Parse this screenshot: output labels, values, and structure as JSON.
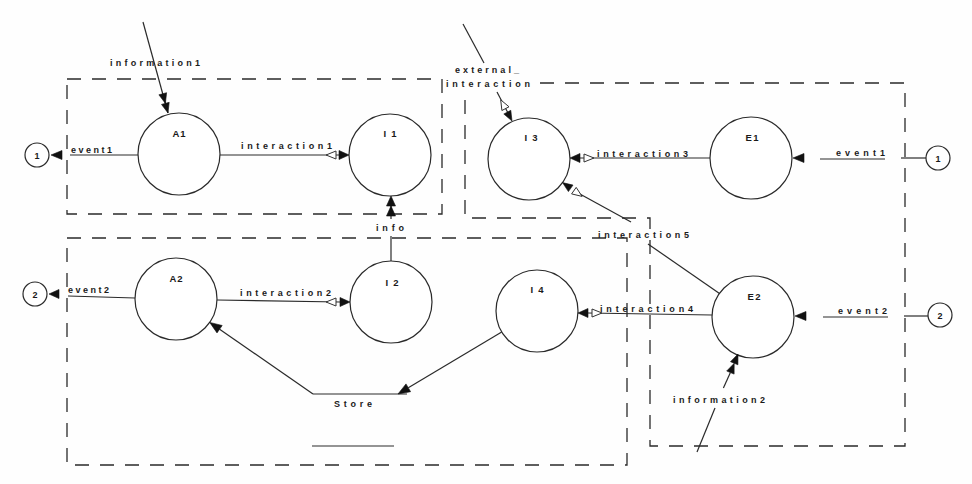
{
  "nodes": {
    "A1": {
      "label": "A1"
    },
    "I1": {
      "label": "I1"
    },
    "I3": {
      "label": "I3"
    },
    "E1": {
      "label": "E1"
    },
    "A2": {
      "label": "A2"
    },
    "I2": {
      "label": "I2"
    },
    "I4": {
      "label": "I4"
    },
    "E2": {
      "label": "E2"
    }
  },
  "connectors": {
    "left_1": "1",
    "left_2": "2",
    "right_1": "1",
    "right_2": "2"
  },
  "store": {
    "label": "Store"
  },
  "flows": {
    "information1": "information1",
    "external_interaction_line1": "external_",
    "external_interaction_line2": "interaction",
    "interaction1": "interaction1",
    "interaction2": "interaction2",
    "interaction3": "interaction3",
    "interaction4": "interaction4",
    "interaction5": "interaction5",
    "info": "info",
    "information2": "information2",
    "event1_left": "event1",
    "event2_left": "event2",
    "event1_right": "event1",
    "event2_right": "event2"
  },
  "edges": [
    {
      "label": "information1",
      "from": null,
      "to": "A1"
    },
    {
      "label": "external_interaction",
      "from": null,
      "to": "I3"
    },
    {
      "label": "interaction1",
      "from": "A1",
      "to": "I1"
    },
    {
      "label": "interaction2",
      "from": "A2",
      "to": "I2"
    },
    {
      "label": "interaction3",
      "from": "E1",
      "to": "I3"
    },
    {
      "label": "interaction4",
      "from": "E2",
      "to": "I4"
    },
    {
      "label": "interaction5",
      "from": "E2",
      "to": "I3"
    },
    {
      "label": "info",
      "from": "I2",
      "to": "I1"
    },
    {
      "label": "information2",
      "from": null,
      "to": "E2"
    },
    {
      "label": "event1",
      "from": "A1",
      "to": "1"
    },
    {
      "label": "event2",
      "from": "A2",
      "to": "2"
    },
    {
      "label": "event1",
      "from": "1",
      "to": "E1"
    },
    {
      "label": "event2",
      "from": "2",
      "to": "E2"
    },
    {
      "label": "",
      "from": "I4",
      "to": "Store"
    },
    {
      "label": "",
      "from": "Store",
      "to": "A2"
    }
  ]
}
